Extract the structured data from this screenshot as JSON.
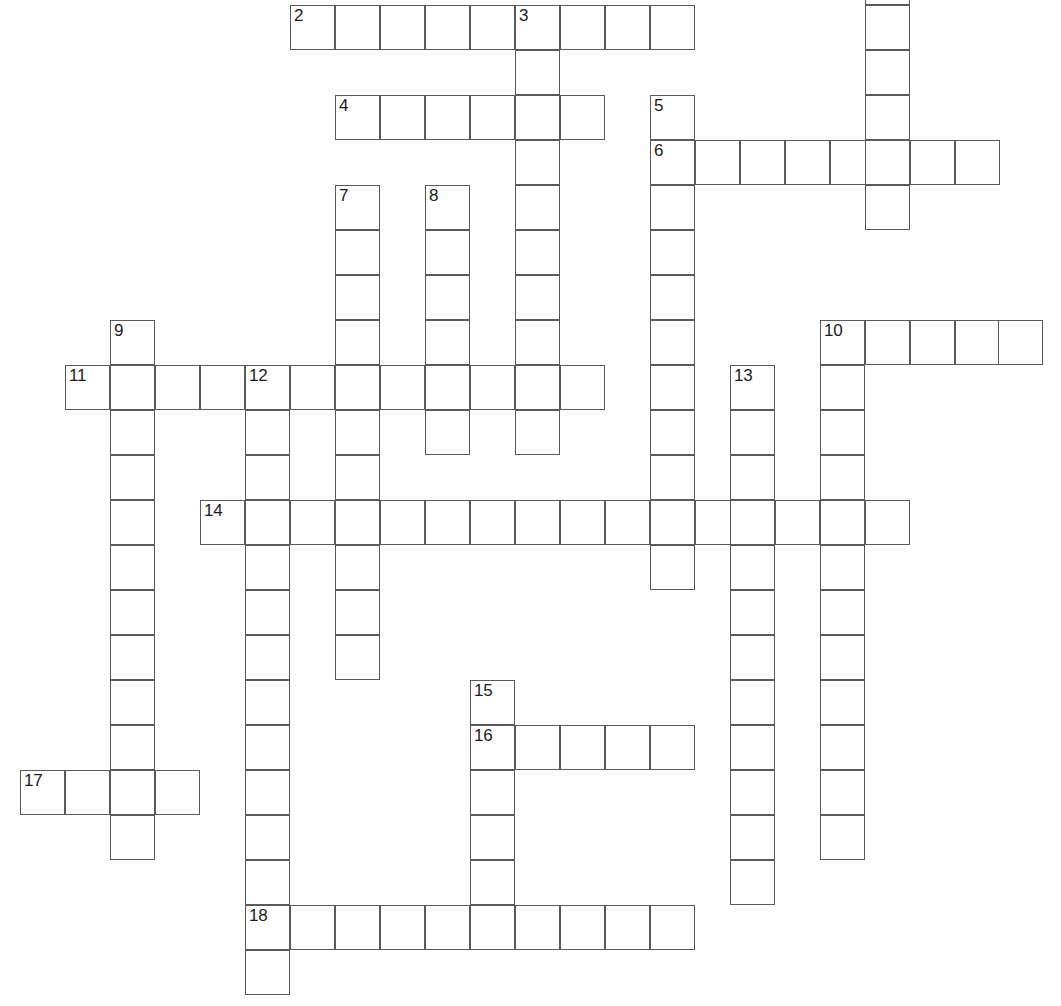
{
  "document": {
    "type": "crossword-puzzle-grid",
    "title": "Crossword Puzzle",
    "background_color": "#ffffff",
    "line_color": "#5a5a5a",
    "number_color": "#1c1c1c",
    "cell_size_px": 45,
    "canvas": {
      "width": 1061,
      "height": 1006
    }
  },
  "entries": [
    {
      "number": "2",
      "direction": "across",
      "length": 9,
      "col": 6,
      "row": 0
    },
    {
      "number": "3",
      "direction": "down",
      "length": 10,
      "col": 11,
      "row": 0
    },
    {
      "number": "4",
      "direction": "across",
      "length": 6,
      "col": 7,
      "row": 2
    },
    {
      "number": "5",
      "direction": "down",
      "length": 11,
      "col": 14,
      "row": 2
    },
    {
      "number": "6",
      "direction": "across",
      "length": 8,
      "col": 14,
      "row": 3
    },
    {
      "number": "7",
      "direction": "down",
      "length": 11,
      "col": 7,
      "row": 4
    },
    {
      "number": "8",
      "direction": "down",
      "length": 5,
      "col": 9,
      "row": 4
    },
    {
      "number": "9",
      "direction": "down",
      "length": 12,
      "col": 2,
      "row": 7
    },
    {
      "number": "10",
      "direction": "across",
      "length": 5,
      "col": 18,
      "row": 7
    },
    {
      "number": "10",
      "direction": "down",
      "length": 12,
      "col": 18,
      "row": 7
    },
    {
      "number": "11",
      "direction": "across",
      "length": 12,
      "col": 1,
      "row": 8
    },
    {
      "number": "12",
      "direction": "down",
      "length": 14,
      "col": 5,
      "row": 8
    },
    {
      "number": "13",
      "direction": "down",
      "length": 12,
      "col": 16,
      "row": 8
    },
    {
      "number": "14",
      "direction": "across",
      "length": 16,
      "col": 4,
      "row": 11
    },
    {
      "number": "15",
      "direction": "down",
      "length": 6,
      "col": 10,
      "row": 15
    },
    {
      "number": "16",
      "direction": "across",
      "length": 5,
      "col": 10,
      "row": 16
    },
    {
      "number": "17",
      "direction": "across",
      "length": 4,
      "col": 0,
      "row": 17
    },
    {
      "number": "18",
      "direction": "across",
      "length": 10,
      "col": 5,
      "row": 20
    }
  ],
  "numbered_cells": [
    {
      "label": "2",
      "x": 290,
      "y": 5
    },
    {
      "label": "3",
      "x": 515,
      "y": 5
    },
    {
      "label": "4",
      "x": 335,
      "y": 95
    },
    {
      "label": "5",
      "x": 650,
      "y": 95
    },
    {
      "label": "6",
      "x": 650,
      "y": 140
    },
    {
      "label": "7",
      "x": 335,
      "y": 185
    },
    {
      "label": "8",
      "x": 425,
      "y": 185
    },
    {
      "label": "9",
      "x": 110,
      "y": 320
    },
    {
      "label": "10",
      "x": 820,
      "y": 320
    },
    {
      "label": "11",
      "x": 65,
      "y": 365
    },
    {
      "label": "12",
      "x": 245,
      "y": 365
    },
    {
      "label": "13",
      "x": 730,
      "y": 365
    },
    {
      "label": "14",
      "x": 200,
      "y": 500
    },
    {
      "label": "15",
      "x": 470,
      "y": 680
    },
    {
      "label": "16",
      "x": 470,
      "y": 725
    },
    {
      "label": "17",
      "x": 20,
      "y": 770
    },
    {
      "label": "18",
      "x": 245,
      "y": 905
    }
  ],
  "cells": [
    {
      "x": 290,
      "y": 5,
      "n": "2"
    },
    {
      "x": 335,
      "y": 5
    },
    {
      "x": 380,
      "y": 5
    },
    {
      "x": 425,
      "y": 5
    },
    {
      "x": 470,
      "y": 5
    },
    {
      "x": 515,
      "y": 5,
      "n": "3"
    },
    {
      "x": 560,
      "y": 5
    },
    {
      "x": 605,
      "y": 5
    },
    {
      "x": 650,
      "y": 5
    },
    {
      "x": 865,
      "y": -40
    },
    {
      "x": 865,
      "y": 5
    },
    {
      "x": 865,
      "y": 50
    },
    {
      "x": 865,
      "y": 95
    },
    {
      "x": 515,
      "y": 50
    },
    {
      "x": 335,
      "y": 95,
      "n": "4"
    },
    {
      "x": 380,
      "y": 95
    },
    {
      "x": 425,
      "y": 95
    },
    {
      "x": 470,
      "y": 95
    },
    {
      "x": 515,
      "y": 95
    },
    {
      "x": 560,
      "y": 95
    },
    {
      "x": 650,
      "y": 95,
      "n": "5"
    },
    {
      "x": 650,
      "y": 140,
      "n": "6"
    },
    {
      "x": 695,
      "y": 140
    },
    {
      "x": 740,
      "y": 140
    },
    {
      "x": 785,
      "y": 140
    },
    {
      "x": 830,
      "y": 140
    },
    {
      "x": 865,
      "y": 140
    },
    {
      "x": 910,
      "y": 140
    },
    {
      "x": 955,
      "y": 140
    },
    {
      "x": 865,
      "y": 185
    },
    {
      "x": 335,
      "y": 185,
      "n": "7"
    },
    {
      "x": 425,
      "y": 185,
      "n": "8"
    },
    {
      "x": 515,
      "y": 140
    },
    {
      "x": 515,
      "y": 185
    },
    {
      "x": 335,
      "y": 230
    },
    {
      "x": 425,
      "y": 230
    },
    {
      "x": 515,
      "y": 230
    },
    {
      "x": 650,
      "y": 185
    },
    {
      "x": 650,
      "y": 230
    },
    {
      "x": 335,
      "y": 275
    },
    {
      "x": 425,
      "y": 275
    },
    {
      "x": 515,
      "y": 275
    },
    {
      "x": 650,
      "y": 275
    },
    {
      "x": 335,
      "y": 320
    },
    {
      "x": 425,
      "y": 320
    },
    {
      "x": 515,
      "y": 320
    },
    {
      "x": 650,
      "y": 320
    },
    {
      "x": 110,
      "y": 320,
      "n": "9"
    },
    {
      "x": 820,
      "y": 320,
      "n": "10"
    },
    {
      "x": 865,
      "y": 320
    },
    {
      "x": 910,
      "y": 320
    },
    {
      "x": 955,
      "y": 320
    },
    {
      "x": 998,
      "y": 320
    },
    {
      "x": 65,
      "y": 365,
      "n": "11"
    },
    {
      "x": 110,
      "y": 365
    },
    {
      "x": 155,
      "y": 365
    },
    {
      "x": 200,
      "y": 365
    },
    {
      "x": 245,
      "y": 365,
      "n": "12"
    },
    {
      "x": 290,
      "y": 365
    },
    {
      "x": 335,
      "y": 365
    },
    {
      "x": 380,
      "y": 365
    },
    {
      "x": 425,
      "y": 365
    },
    {
      "x": 470,
      "y": 365
    },
    {
      "x": 515,
      "y": 365
    },
    {
      "x": 560,
      "y": 365
    },
    {
      "x": 650,
      "y": 365
    },
    {
      "x": 730,
      "y": 365,
      "n": "13"
    },
    {
      "x": 820,
      "y": 365
    },
    {
      "x": 110,
      "y": 410
    },
    {
      "x": 245,
      "y": 410
    },
    {
      "x": 335,
      "y": 410
    },
    {
      "x": 425,
      "y": 410
    },
    {
      "x": 515,
      "y": 410
    },
    {
      "x": 650,
      "y": 410
    },
    {
      "x": 730,
      "y": 410
    },
    {
      "x": 820,
      "y": 410
    },
    {
      "x": 110,
      "y": 455
    },
    {
      "x": 245,
      "y": 455
    },
    {
      "x": 335,
      "y": 455
    },
    {
      "x": 650,
      "y": 455
    },
    {
      "x": 730,
      "y": 455
    },
    {
      "x": 820,
      "y": 455
    },
    {
      "x": 200,
      "y": 500,
      "n": "14"
    },
    {
      "x": 245,
      "y": 500
    },
    {
      "x": 290,
      "y": 500
    },
    {
      "x": 335,
      "y": 500
    },
    {
      "x": 380,
      "y": 500
    },
    {
      "x": 425,
      "y": 500
    },
    {
      "x": 470,
      "y": 500
    },
    {
      "x": 515,
      "y": 500
    },
    {
      "x": 560,
      "y": 500
    },
    {
      "x": 605,
      "y": 500
    },
    {
      "x": 650,
      "y": 500
    },
    {
      "x": 695,
      "y": 500
    },
    {
      "x": 730,
      "y": 500
    },
    {
      "x": 775,
      "y": 500
    },
    {
      "x": 820,
      "y": 500
    },
    {
      "x": 865,
      "y": 500
    },
    {
      "x": 110,
      "y": 500
    },
    {
      "x": 110,
      "y": 545
    },
    {
      "x": 245,
      "y": 545
    },
    {
      "x": 335,
      "y": 545
    },
    {
      "x": 650,
      "y": 545
    },
    {
      "x": 730,
      "y": 545
    },
    {
      "x": 820,
      "y": 545
    },
    {
      "x": 110,
      "y": 590
    },
    {
      "x": 245,
      "y": 590
    },
    {
      "x": 335,
      "y": 590
    },
    {
      "x": 730,
      "y": 590
    },
    {
      "x": 820,
      "y": 590
    },
    {
      "x": 110,
      "y": 635
    },
    {
      "x": 245,
      "y": 635
    },
    {
      "x": 335,
      "y": 635
    },
    {
      "x": 730,
      "y": 635
    },
    {
      "x": 820,
      "y": 635
    },
    {
      "x": 110,
      "y": 680
    },
    {
      "x": 245,
      "y": 680
    },
    {
      "x": 470,
      "y": 680,
      "n": "15"
    },
    {
      "x": 730,
      "y": 680
    },
    {
      "x": 820,
      "y": 680
    },
    {
      "x": 110,
      "y": 725
    },
    {
      "x": 245,
      "y": 725
    },
    {
      "x": 470,
      "y": 725,
      "n": "16"
    },
    {
      "x": 515,
      "y": 725
    },
    {
      "x": 560,
      "y": 725
    },
    {
      "x": 605,
      "y": 725
    },
    {
      "x": 650,
      "y": 725
    },
    {
      "x": 730,
      "y": 725
    },
    {
      "x": 820,
      "y": 725
    },
    {
      "x": 20,
      "y": 770,
      "n": "17"
    },
    {
      "x": 65,
      "y": 770
    },
    {
      "x": 110,
      "y": 770
    },
    {
      "x": 155,
      "y": 770
    },
    {
      "x": 245,
      "y": 770
    },
    {
      "x": 470,
      "y": 770
    },
    {
      "x": 730,
      "y": 770
    },
    {
      "x": 820,
      "y": 770
    },
    {
      "x": 110,
      "y": 815
    },
    {
      "x": 245,
      "y": 815
    },
    {
      "x": 470,
      "y": 815
    },
    {
      "x": 730,
      "y": 815
    },
    {
      "x": 820,
      "y": 815
    },
    {
      "x": 245,
      "y": 860
    },
    {
      "x": 470,
      "y": 860
    },
    {
      "x": 730,
      "y": 860
    },
    {
      "x": 245,
      "y": 905,
      "n": "18"
    },
    {
      "x": 290,
      "y": 905
    },
    {
      "x": 335,
      "y": 905
    },
    {
      "x": 380,
      "y": 905
    },
    {
      "x": 425,
      "y": 905
    },
    {
      "x": 470,
      "y": 905
    },
    {
      "x": 515,
      "y": 905
    },
    {
      "x": 560,
      "y": 905
    },
    {
      "x": 605,
      "y": 905
    },
    {
      "x": 650,
      "y": 905
    },
    {
      "x": 245,
      "y": 950
    }
  ]
}
